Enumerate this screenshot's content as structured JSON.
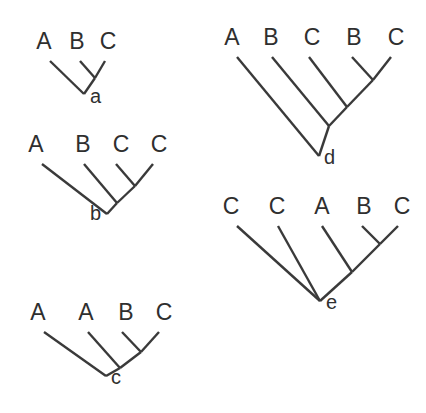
{
  "figure": {
    "background_color": "#ffffff",
    "line_color": "#3a3a3a",
    "text_color": "#2f2f2f",
    "width": 426,
    "height": 413
  },
  "trees": [
    {
      "id": "a",
      "node_label": "a",
      "node_label_side": "right",
      "root": {
        "x": 84,
        "y": 94
      },
      "tips": [
        {
          "label": "A",
          "text_x": 44,
          "text_y": 49,
          "branch_x": 50,
          "branch_y": 61
        },
        {
          "label": "B",
          "text_x": 77,
          "text_y": 49,
          "branch_x": 80,
          "branch_y": 61
        },
        {
          "label": "C",
          "text_x": 108,
          "text_y": 49,
          "branch_x": 105,
          "branch_y": 61
        }
      ],
      "internal_nodes": [
        {
          "name": "bc-node",
          "x": 95,
          "y": 78
        }
      ],
      "branches": [
        {
          "name": "A-to-root",
          "x1": 50,
          "y1": 61,
          "x2": 84,
          "y2": 94
        },
        {
          "name": "B-to-bc-node",
          "x1": 80,
          "y1": 61,
          "x2": 95,
          "y2": 78
        },
        {
          "name": "C-to-bc-node",
          "x1": 105,
          "y1": 61,
          "x2": 95,
          "y2": 78
        },
        {
          "name": "bc-node-to-root",
          "x1": 95,
          "y1": 78,
          "x2": 84,
          "y2": 94
        }
      ],
      "node_label_pos": {
        "x": 90,
        "y": 103
      }
    },
    {
      "id": "b",
      "node_label": "b",
      "node_label_side": "left",
      "root": {
        "x": 107,
        "y": 214
      },
      "tips": [
        {
          "label": "A",
          "text_x": 36,
          "text_y": 152,
          "branch_x": 42,
          "branch_y": 164
        },
        {
          "label": "B",
          "text_x": 83,
          "text_y": 152,
          "branch_x": 84,
          "branch_y": 164
        },
        {
          "label": "C",
          "text_x": 121,
          "text_y": 152,
          "branch_x": 116,
          "branch_y": 164
        },
        {
          "label": "C",
          "text_x": 159,
          "text_y": 152,
          "branch_x": 153,
          "branch_y": 164
        }
      ],
      "internal_nodes": [
        {
          "name": "cc-node",
          "x": 135,
          "y": 186
        },
        {
          "name": "bcc-node",
          "x": 117,
          "y": 203
        }
      ],
      "branches": [
        {
          "name": "A-to-root",
          "x1": 42,
          "y1": 164,
          "x2": 107,
          "y2": 214
        },
        {
          "name": "B-to-bcc-node",
          "x1": 84,
          "y1": 164,
          "x2": 117,
          "y2": 203
        },
        {
          "name": "C1-to-cc-node",
          "x1": 116,
          "y1": 164,
          "x2": 135,
          "y2": 186
        },
        {
          "name": "C2-to-cc-node",
          "x1": 153,
          "y1": 164,
          "x2": 135,
          "y2": 186
        },
        {
          "name": "cc-node-to-bcc-node",
          "x1": 135,
          "y1": 186,
          "x2": 117,
          "y2": 203
        },
        {
          "name": "bcc-node-to-root",
          "x1": 117,
          "y1": 203,
          "x2": 107,
          "y2": 214
        }
      ],
      "node_label_pos": {
        "x": 101,
        "y": 220
      }
    },
    {
      "id": "c",
      "node_label": "c",
      "node_label_side": "right",
      "root": {
        "x": 106,
        "y": 376
      },
      "tips": [
        {
          "label": "A",
          "text_x": 38,
          "text_y": 320,
          "branch_x": 44,
          "branch_y": 332
        },
        {
          "label": "A",
          "text_x": 86,
          "text_y": 320,
          "branch_x": 88,
          "branch_y": 332
        },
        {
          "label": "B",
          "text_x": 126,
          "text_y": 320,
          "branch_x": 122,
          "branch_y": 332
        },
        {
          "label": "C",
          "text_x": 164,
          "text_y": 320,
          "branch_x": 159,
          "branch_y": 332
        }
      ],
      "internal_nodes": [
        {
          "name": "bc-node",
          "x": 141,
          "y": 352
        },
        {
          "name": "abc-node",
          "x": 120,
          "y": 368
        }
      ],
      "branches": [
        {
          "name": "A1-to-root",
          "x1": 44,
          "y1": 332,
          "x2": 106,
          "y2": 376
        },
        {
          "name": "A2-to-abc-node",
          "x1": 88,
          "y1": 332,
          "x2": 120,
          "y2": 368
        },
        {
          "name": "B-to-bc-node",
          "x1": 122,
          "y1": 332,
          "x2": 141,
          "y2": 352
        },
        {
          "name": "C-to-bc-node",
          "x1": 159,
          "y1": 332,
          "x2": 141,
          "y2": 352
        },
        {
          "name": "bc-node-to-abc-node",
          "x1": 141,
          "y1": 352,
          "x2": 120,
          "y2": 368
        },
        {
          "name": "abc-node-to-root",
          "x1": 120,
          "y1": 368,
          "x2": 106,
          "y2": 376
        }
      ],
      "node_label_pos": {
        "x": 111,
        "y": 384
      }
    },
    {
      "id": "d",
      "node_label": "d",
      "node_label_side": "right",
      "root": {
        "x": 319,
        "y": 156
      },
      "tips": [
        {
          "label": "A",
          "text_x": 232,
          "text_y": 45,
          "branch_x": 237,
          "branch_y": 57
        },
        {
          "label": "B",
          "text_x": 271,
          "text_y": 45,
          "branch_x": 272,
          "branch_y": 57
        },
        {
          "label": "C",
          "text_x": 312,
          "text_y": 45,
          "branch_x": 309,
          "branch_y": 57
        },
        {
          "label": "B",
          "text_x": 354,
          "text_y": 45,
          "branch_x": 352,
          "branch_y": 57
        },
        {
          "label": "C",
          "text_x": 396,
          "text_y": 45,
          "branch_x": 391,
          "branch_y": 57
        }
      ],
      "internal_nodes": [
        {
          "name": "bc-node",
          "x": 373,
          "y": 80
        },
        {
          "name": "cbc-node",
          "x": 347,
          "y": 107
        },
        {
          "name": "bcbc-node",
          "x": 329,
          "y": 126
        }
      ],
      "branches": [
        {
          "name": "A-to-root",
          "x1": 237,
          "y1": 57,
          "x2": 319,
          "y2": 156
        },
        {
          "name": "B1-to-bcbc-node",
          "x1": 272,
          "y1": 57,
          "x2": 329,
          "y2": 126
        },
        {
          "name": "C1-to-cbc-node",
          "x1": 309,
          "y1": 57,
          "x2": 347,
          "y2": 107
        },
        {
          "name": "B2-to-bc-node",
          "x1": 352,
          "y1": 57,
          "x2": 373,
          "y2": 80
        },
        {
          "name": "C2-to-bc-node",
          "x1": 391,
          "y1": 57,
          "x2": 373,
          "y2": 80
        },
        {
          "name": "bc-node-to-cbc-node",
          "x1": 373,
          "y1": 80,
          "x2": 347,
          "y2": 107
        },
        {
          "name": "cbc-node-to-bcbc-node",
          "x1": 347,
          "y1": 107,
          "x2": 329,
          "y2": 126
        },
        {
          "name": "bcbc-node-to-root",
          "x1": 329,
          "y1": 126,
          "x2": 319,
          "y2": 156
        }
      ],
      "node_label_pos": {
        "x": 324,
        "y": 164
      }
    },
    {
      "id": "e",
      "node_label": "e",
      "node_label_side": "right",
      "root": {
        "x": 320,
        "y": 301
      },
      "tips": [
        {
          "label": "C",
          "text_x": 231,
          "text_y": 214,
          "branch_x": 237,
          "branch_y": 226
        },
        {
          "label": "C",
          "text_x": 277,
          "text_y": 214,
          "branch_x": 278,
          "branch_y": 226
        },
        {
          "label": "A",
          "text_x": 322,
          "text_y": 214,
          "branch_x": 322,
          "branch_y": 226
        },
        {
          "label": "B",
          "text_x": 364,
          "text_y": 214,
          "branch_x": 362,
          "branch_y": 226
        },
        {
          "label": "C",
          "text_x": 402,
          "text_y": 214,
          "branch_x": 398,
          "branch_y": 226
        }
      ],
      "internal_nodes": [
        {
          "name": "bc-node",
          "x": 380,
          "y": 244
        },
        {
          "name": "abc-node",
          "x": 352,
          "y": 272
        }
      ],
      "branches": [
        {
          "name": "C1-to-root",
          "x1": 237,
          "y1": 226,
          "x2": 320,
          "y2": 301
        },
        {
          "name": "C2-to-root",
          "x1": 278,
          "y1": 226,
          "x2": 320,
          "y2": 301
        },
        {
          "name": "A-to-abc-node",
          "x1": 322,
          "y1": 226,
          "x2": 352,
          "y2": 272
        },
        {
          "name": "B-to-bc-node",
          "x1": 362,
          "y1": 226,
          "x2": 380,
          "y2": 244
        },
        {
          "name": "C3-to-bc-node",
          "x1": 398,
          "y1": 226,
          "x2": 380,
          "y2": 244
        },
        {
          "name": "bc-node-to-abc-node",
          "x1": 380,
          "y1": 244,
          "x2": 352,
          "y2": 272
        },
        {
          "name": "abc-node-to-root",
          "x1": 352,
          "y1": 272,
          "x2": 320,
          "y2": 301
        }
      ],
      "node_label_pos": {
        "x": 326,
        "y": 309
      }
    }
  ]
}
